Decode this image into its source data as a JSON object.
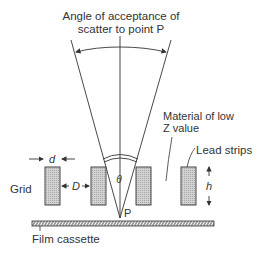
{
  "title": {
    "line1": "Angle of acceptance of",
    "line2": "scatter to point P"
  },
  "labels": {
    "grid": "Grid",
    "film_cassette": "Film cassette",
    "d": "d",
    "D": "D",
    "h": "h",
    "theta": "θ",
    "P": "P",
    "material_line1": "Material of low",
    "material_line2": "Z value",
    "lead_strips": "Lead strips"
  },
  "colors": {
    "line": "#333333",
    "strip_fill": "#c8c8c8",
    "background": "#ffffff"
  }
}
